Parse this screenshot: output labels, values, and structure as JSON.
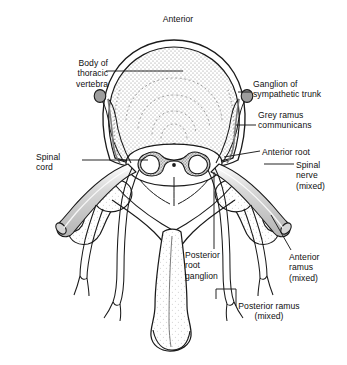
{
  "figure": {
    "kind": "anatomical-diagram",
    "orientation_label": "Anterior",
    "background_color": "#ffffff",
    "line_color": "#1a1a1a",
    "tissue_fill_color": "#c9c9c9",
    "stipple_color": "#7d7d7d"
  },
  "labels": {
    "anterior": "Anterior",
    "body_of_thoracic_vertebra": "Body of\nthoracic\nvertebra",
    "ganglion_of_sympathetic_trunk": "Ganglion of\nsympathetic trunk",
    "grey_ramus_communicans": "Grey ramus\ncommunicans",
    "anterior_root": "Anterior root",
    "spinal_cord": "Spinal\ncord",
    "spinal_nerve_mixed": "Spinal\nnerve\n(mixed)",
    "posterior_root_ganglion": "Posterior\nroot\nganglion",
    "anterior_ramus_mixed": "Anterior\nramus\n(mixed)",
    "posterior_ramus_mixed": "Posterior ramus\n(mixed)"
  },
  "structures": [
    {
      "name": "vertebral-body",
      "description": "large rounded anterior body of thoracic vertebra, stippled"
    },
    {
      "name": "spinal-cord",
      "description": "oval cord with butterfly-shaped grey matter and central canal"
    },
    {
      "name": "central-canal",
      "description": "small dot at centre of grey matter"
    },
    {
      "name": "sympathetic-ganglion-left",
      "description": "small filled oval on left anterolateral body"
    },
    {
      "name": "sympathetic-ganglion-right",
      "description": "small filled oval on right anterolateral body"
    },
    {
      "name": "grey-ramus-communicans-left",
      "description": "nerve connecting left ganglion to spinal nerve"
    },
    {
      "name": "grey-ramus-communicans-right",
      "description": "nerve connecting right ganglion to spinal nerve"
    },
    {
      "name": "anterior-root-left",
      "description": "ventral root emerging from left cord"
    },
    {
      "name": "anterior-root-right",
      "description": "ventral root emerging from right cord"
    },
    {
      "name": "posterior-root-ganglion-left",
      "description": "dorsal root ganglion swelling on left"
    },
    {
      "name": "posterior-root-ganglion-right",
      "description": "dorsal root ganglion swelling on right"
    },
    {
      "name": "spinal-nerve-left",
      "description": "mixed spinal nerve trunk passing laterally left"
    },
    {
      "name": "spinal-nerve-right",
      "description": "mixed spinal nerve trunk passing laterally right"
    },
    {
      "name": "anterior-ramus-left",
      "description": "ventral ramus descending on left"
    },
    {
      "name": "anterior-ramus-right",
      "description": "ventral ramus descending on right"
    },
    {
      "name": "posterior-ramus-left",
      "description": "dorsal ramus descending and bifurcating on left"
    },
    {
      "name": "posterior-ramus-right",
      "description": "dorsal ramus descending and bifurcating on right"
    },
    {
      "name": "transverse-process-left",
      "description": "lateral bony projection left"
    },
    {
      "name": "transverse-process-right",
      "description": "lateral bony projection right"
    },
    {
      "name": "pedicle-lamina",
      "description": "vertebral arch enclosing vertebral canal"
    },
    {
      "name": "spinous-process",
      "description": "long posterior midline process with bulbous tip"
    }
  ]
}
